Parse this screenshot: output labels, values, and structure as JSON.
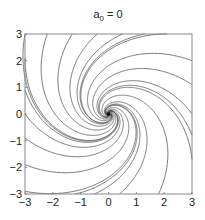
{
  "chart_data": {
    "type": "line",
    "subtype": "phase-portrait",
    "title_main": "a",
    "title_sub": "0",
    "title_rest": " = 0",
    "xlabel": "",
    "ylabel": "",
    "xlim": [
      -3,
      3
    ],
    "ylim": [
      -3,
      3
    ],
    "xticks": [
      -3,
      -2,
      -1,
      0,
      1,
      2,
      3
    ],
    "yticks": [
      -3,
      -2,
      -1,
      0,
      1,
      2,
      3
    ],
    "xtick_labels": [
      "−3",
      "−2",
      "−1",
      "0",
      "1",
      "2",
      "3"
    ],
    "ytick_labels": [
      "−3",
      "−2",
      "−1",
      "0",
      "1",
      "2",
      "3"
    ],
    "grid": false,
    "legend": null,
    "system": {
      "decay": 1.0,
      "rotation": 1.4
    },
    "start_points": [
      [
        -3,
        3
      ],
      [
        -2.2,
        3
      ],
      [
        -1.3,
        3
      ],
      [
        -0.4,
        3
      ],
      [
        0.5,
        3
      ],
      [
        1.3,
        3
      ],
      [
        2.1,
        3
      ],
      [
        3,
        2.0
      ],
      [
        3,
        1.1
      ],
      [
        3,
        0.0
      ],
      [
        3,
        -0.8
      ],
      [
        3,
        -1.7
      ],
      [
        1.8,
        -3
      ],
      [
        0.4,
        -3
      ],
      [
        -0.5,
        -3
      ],
      [
        -1.2,
        -3
      ],
      [
        -3,
        -2.9
      ],
      [
        -3,
        -1.9
      ],
      [
        -3,
        -0.9
      ],
      [
        -3,
        0.0
      ],
      [
        -3,
        0.9
      ],
      [
        -3,
        2.1
      ]
    ],
    "colors": {
      "line": "#555555",
      "axis": "#888888",
      "text": "#222222"
    }
  }
}
